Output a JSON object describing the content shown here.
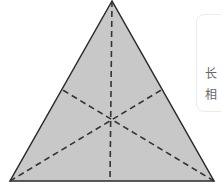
{
  "diagram": {
    "type": "triangle-with-medians",
    "colors": {
      "fill": "#c8c8c8",
      "stroke": "#2a2a2a",
      "dash": "#333333"
    },
    "vertices": {
      "apex": [
        112,
        1
      ],
      "left": [
        10,
        181
      ],
      "right": [
        214,
        181
      ]
    },
    "midpoints": {
      "left_side": [
        61,
        89
      ],
      "right_side": [
        163,
        89
      ],
      "base": [
        110,
        181
      ]
    },
    "centroid": [
      111,
      118
    ]
  },
  "side_card": {
    "lines": [
      "长",
      "相"
    ]
  }
}
